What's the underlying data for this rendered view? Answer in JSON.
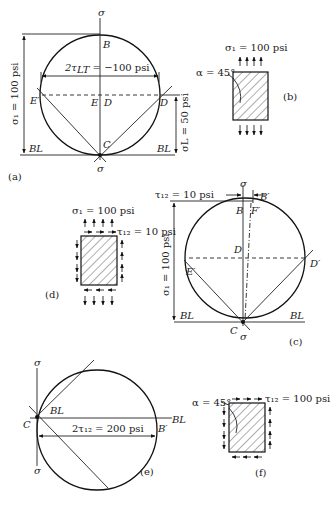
{
  "figure": {
    "panels": {
      "a": {
        "label": "(a)",
        "top_axis": "σ",
        "bottom_axis": "σ",
        "points": {
          "B": "B",
          "E_prime": "E′",
          "E": "E",
          "D": "D",
          "D_prime": "D",
          "C": "C"
        },
        "baseline_left": "BL",
        "baseline_right": "BL",
        "shear_dim": "2τ",
        "shear_sub": "LT",
        "shear_val": " = −100 psi",
        "sigma1_dim": "σ₁ = 100 psi",
        "sigmaL_dim": "σL = 50 psi"
      },
      "b": {
        "label": "(b)",
        "stress": "σ₁ = 100 psi",
        "angle": "α = 45°"
      },
      "c": {
        "label": "(c)",
        "tau_label": "τ₁₂ = 10 psi",
        "top_axis": "σ",
        "bottom_axis": "σ",
        "points": {
          "B": "B",
          "B_prime": "B′",
          "F_prime": "F′",
          "D": "D",
          "D_prime": "D′",
          "E_prime": "E′",
          "C": "C"
        },
        "baseline_left": "BL",
        "baseline_right": "BL",
        "sigma1_dim": "σ₁ = 100 psi"
      },
      "d": {
        "label": "(d)",
        "stress": "σ₁ = 100 psi",
        "shear": "τ₁₂ = 10 psi"
      },
      "e": {
        "label": "(e)",
        "top_axis": "σ",
        "bottom_axis": "σ",
        "points": {
          "C": "C",
          "B_prime": "B′"
        },
        "baseline_left": "BL",
        "baseline_right": "BL",
        "shear_dim": "2τ₁₂ = 200 psi"
      },
      "f": {
        "label": "(f)",
        "angle": "α = 45°",
        "shear": "τ₁₂ = 100 psi"
      }
    }
  }
}
